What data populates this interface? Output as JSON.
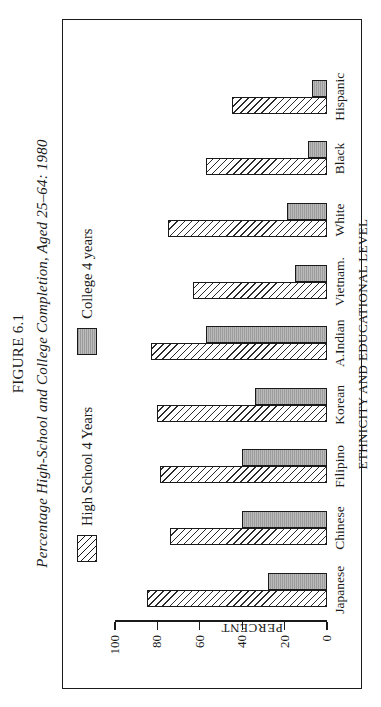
{
  "figure": {
    "number_label": "FIGURE 6.1",
    "title": "Percentage High-School and College Completion, Aged 25–64: 1980"
  },
  "legend": {
    "position": "top-center",
    "items": [
      {
        "label": "High School 4 Years",
        "pattern": "diagonal-hatch",
        "color": "#ffffff"
      },
      {
        "label": "College 4 years",
        "pattern": "solid-gray",
        "color": "#9c9c9c"
      }
    ]
  },
  "chart_data": {
    "type": "bar",
    "title": "Percentage High-School and College Completion, Aged 25–64: 1980",
    "xlabel": "ETHNICITY AND EDUCATIONAL LEVEL",
    "ylabel": "PERCENT",
    "ylim": [
      0,
      100
    ],
    "yticks": [
      0,
      20,
      40,
      60,
      80,
      100
    ],
    "ytick_labels": [
      "0",
      "20",
      "40",
      "60",
      "80",
      "100"
    ],
    "grid": false,
    "legend_position": "top-center",
    "categories": [
      "Japanese",
      "Chinese",
      "Filipino",
      "Korean",
      "A.Indian",
      "Vietnam.",
      "White",
      "Black",
      "Hispanic"
    ],
    "series": [
      {
        "name": "High School 4 Years",
        "values": [
          85,
          74,
          79,
          80,
          83,
          63,
          75,
          57,
          45
        ]
      },
      {
        "name": "College 4 years",
        "values": [
          28,
          40,
          40,
          34,
          57,
          15,
          19,
          9,
          7
        ]
      }
    ]
  }
}
